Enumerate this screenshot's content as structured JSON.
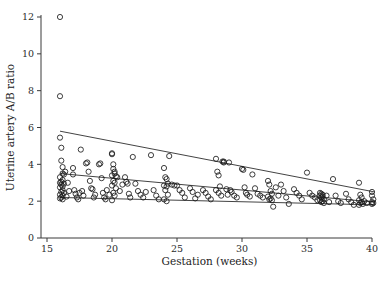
{
  "chart_data": {
    "type": "scatter",
    "title": "",
    "xlabel": "Gestation (weeks)",
    "ylabel": "Uterine artery A/B ratio",
    "xlim": [
      15,
      40
    ],
    "ylim": [
      0,
      12
    ],
    "xticks": [
      15,
      20,
      25,
      30,
      35,
      40
    ],
    "yticks": [
      0,
      2,
      4,
      6,
      8,
      10,
      12
    ],
    "xtick_labels": [
      "15",
      "20",
      "25",
      "30",
      "35",
      "40"
    ],
    "ytick_labels": [
      "0",
      "2",
      "4",
      "6",
      "8",
      "10",
      "12"
    ],
    "grid": false,
    "legend": "none",
    "marker": "open-circle",
    "marker_size": 2.6,
    "series": [
      {
        "name": "Uterine artery A/B ratio observations",
        "points": [
          [
            16.0,
            12.0
          ],
          [
            16.0,
            7.7
          ],
          [
            16.0,
            5.45
          ],
          [
            16.1,
            4.9
          ],
          [
            16.1,
            4.2
          ],
          [
            16.2,
            3.85
          ],
          [
            16.2,
            3.5
          ],
          [
            16.3,
            3.45
          ],
          [
            16.0,
            3.3
          ],
          [
            16.2,
            3.15
          ],
          [
            16.1,
            3.05
          ],
          [
            16.0,
            3.0
          ],
          [
            16.3,
            2.95
          ],
          [
            16.1,
            2.9
          ],
          [
            16.2,
            2.8
          ],
          [
            16.0,
            2.75
          ],
          [
            16.2,
            2.6
          ],
          [
            16.1,
            2.5
          ],
          [
            16.3,
            2.45
          ],
          [
            16.0,
            2.35
          ],
          [
            16.2,
            2.3
          ],
          [
            16.1,
            2.2
          ],
          [
            16.0,
            2.15
          ],
          [
            16.2,
            2.1
          ],
          [
            16.4,
            3.6
          ],
          [
            16.5,
            2.25
          ],
          [
            16.6,
            3.0
          ],
          [
            16.7,
            2.55
          ],
          [
            17.0,
            3.8
          ],
          [
            17.0,
            3.45
          ],
          [
            17.1,
            2.6
          ],
          [
            17.2,
            2.4
          ],
          [
            17.3,
            2.2
          ],
          [
            17.4,
            2.1
          ],
          [
            17.5,
            2.45
          ],
          [
            17.6,
            4.8
          ],
          [
            17.7,
            2.55
          ],
          [
            17.8,
            2.3
          ],
          [
            18.0,
            4.05
          ],
          [
            18.1,
            4.1
          ],
          [
            18.2,
            3.6
          ],
          [
            18.3,
            3.1
          ],
          [
            18.4,
            2.7
          ],
          [
            18.5,
            2.65
          ],
          [
            18.6,
            2.2
          ],
          [
            18.7,
            2.35
          ],
          [
            19.0,
            4.0
          ],
          [
            19.1,
            4.05
          ],
          [
            19.2,
            3.25
          ],
          [
            19.3,
            2.45
          ],
          [
            19.4,
            2.2
          ],
          [
            19.5,
            2.1
          ],
          [
            19.6,
            2.6
          ],
          [
            19.8,
            2.35
          ],
          [
            20.0,
            4.6
          ],
          [
            20.0,
            4.55
          ],
          [
            20.1,
            4.0
          ],
          [
            20.1,
            3.75
          ],
          [
            20.2,
            3.6
          ],
          [
            20.2,
            3.5
          ],
          [
            20.0,
            3.4
          ],
          [
            20.3,
            3.35
          ],
          [
            20.1,
            3.1
          ],
          [
            20.2,
            3.0
          ],
          [
            20.0,
            2.85
          ],
          [
            20.3,
            2.7
          ],
          [
            20.1,
            2.45
          ],
          [
            20.2,
            2.3
          ],
          [
            20.0,
            2.05
          ],
          [
            20.4,
            3.3
          ],
          [
            20.6,
            2.55
          ],
          [
            20.8,
            2.9
          ],
          [
            21.0,
            3.3
          ],
          [
            21.1,
            3.05
          ],
          [
            21.2,
            2.95
          ],
          [
            21.3,
            2.4
          ],
          [
            21.4,
            2.2
          ],
          [
            21.6,
            4.4
          ],
          [
            21.8,
            2.95
          ],
          [
            22.0,
            2.55
          ],
          [
            22.2,
            2.35
          ],
          [
            22.4,
            2.2
          ],
          [
            22.6,
            2.5
          ],
          [
            23.0,
            4.5
          ],
          [
            23.2,
            2.6
          ],
          [
            23.4,
            2.3
          ],
          [
            23.6,
            2.1
          ],
          [
            24.0,
            3.8
          ],
          [
            24.1,
            3.3
          ],
          [
            24.2,
            3.2
          ],
          [
            24.3,
            2.95
          ],
          [
            24.0,
            2.85
          ],
          [
            24.2,
            2.8
          ],
          [
            24.1,
            2.6
          ],
          [
            24.3,
            2.35
          ],
          [
            24.0,
            2.1
          ],
          [
            24.2,
            2.0
          ],
          [
            24.4,
            4.45
          ],
          [
            24.6,
            2.9
          ],
          [
            24.8,
            2.85
          ],
          [
            25.0,
            2.85
          ],
          [
            25.2,
            2.6
          ],
          [
            25.4,
            2.45
          ],
          [
            25.6,
            2.2
          ],
          [
            26.0,
            2.7
          ],
          [
            26.2,
            2.5
          ],
          [
            26.4,
            2.15
          ],
          [
            26.6,
            2.35
          ],
          [
            27.0,
            2.6
          ],
          [
            27.2,
            2.45
          ],
          [
            27.4,
            2.25
          ],
          [
            27.6,
            2.1
          ],
          [
            28.0,
            4.3
          ],
          [
            28.1,
            3.6
          ],
          [
            28.2,
            3.4
          ],
          [
            28.3,
            2.8
          ],
          [
            28.0,
            2.6
          ],
          [
            28.2,
            2.45
          ],
          [
            28.4,
            2.3
          ],
          [
            28.5,
            4.15
          ],
          [
            28.6,
            4.15
          ],
          [
            28.6,
            4.1
          ],
          [
            28.8,
            2.65
          ],
          [
            28.9,
            2.35
          ],
          [
            29.0,
            4.1
          ],
          [
            29.1,
            2.6
          ],
          [
            29.2,
            2.5
          ],
          [
            29.4,
            2.3
          ],
          [
            29.6,
            2.2
          ],
          [
            30.0,
            3.75
          ],
          [
            30.1,
            3.7
          ],
          [
            30.2,
            2.75
          ],
          [
            30.3,
            2.45
          ],
          [
            30.4,
            2.35
          ],
          [
            30.6,
            2.25
          ],
          [
            30.8,
            3.45
          ],
          [
            31.0,
            2.7
          ],
          [
            31.2,
            2.4
          ],
          [
            31.4,
            2.3
          ],
          [
            31.6,
            2.2
          ],
          [
            32.0,
            3.1
          ],
          [
            32.1,
            2.9
          ],
          [
            32.2,
            2.55
          ],
          [
            32.3,
            2.4
          ],
          [
            32.0,
            2.25
          ],
          [
            32.2,
            2.15
          ],
          [
            32.1,
            2.1
          ],
          [
            32.3,
            2.05
          ],
          [
            32.4,
            1.7
          ],
          [
            32.6,
            2.75
          ],
          [
            32.8,
            2.3
          ],
          [
            33.0,
            2.9
          ],
          [
            33.2,
            2.55
          ],
          [
            33.4,
            2.2
          ],
          [
            33.6,
            1.85
          ],
          [
            34.0,
            2.65
          ],
          [
            34.2,
            2.45
          ],
          [
            34.4,
            2.3
          ],
          [
            34.6,
            2.1
          ],
          [
            35.0,
            3.55
          ],
          [
            35.2,
            2.45
          ],
          [
            35.4,
            2.3
          ],
          [
            35.6,
            2.2
          ],
          [
            35.8,
            2.05
          ],
          [
            36.0,
            2.45
          ],
          [
            36.1,
            2.4
          ],
          [
            36.2,
            2.35
          ],
          [
            36.0,
            2.3
          ],
          [
            36.2,
            2.25
          ],
          [
            36.1,
            2.2
          ],
          [
            36.3,
            2.1
          ],
          [
            36.0,
            2.05
          ],
          [
            36.2,
            2.0
          ],
          [
            36.1,
            1.95
          ],
          [
            36.3,
            1.9
          ],
          [
            36.5,
            2.3
          ],
          [
            36.7,
            1.95
          ],
          [
            37.0,
            3.2
          ],
          [
            37.2,
            2.3
          ],
          [
            37.4,
            2.0
          ],
          [
            37.6,
            1.9
          ],
          [
            38.0,
            2.4
          ],
          [
            38.2,
            2.1
          ],
          [
            38.4,
            1.95
          ],
          [
            38.6,
            1.8
          ],
          [
            39.0,
            3.0
          ],
          [
            39.1,
            2.35
          ],
          [
            39.2,
            2.2
          ],
          [
            39.0,
            2.05
          ],
          [
            39.2,
            1.95
          ],
          [
            39.1,
            1.9
          ],
          [
            39.3,
            1.85
          ],
          [
            39.0,
            1.8
          ],
          [
            39.4,
            2.0
          ],
          [
            39.6,
            1.9
          ],
          [
            40.0,
            2.5
          ],
          [
            40.0,
            2.3
          ],
          [
            40.1,
            2.1
          ],
          [
            40.0,
            1.95
          ],
          [
            40.1,
            1.9
          ],
          [
            40.0,
            1.85
          ]
        ]
      }
    ],
    "reference_lines": [
      {
        "name": "upper-reference-line",
        "x": [
          16.0,
          40.2
        ],
        "y": [
          5.8,
          2.5
        ]
      },
      {
        "name": "median-reference-line",
        "x": [
          16.0,
          40.2
        ],
        "y": [
          3.5,
          1.95
        ]
      },
      {
        "name": "lower-reference-line",
        "x": [
          16.0,
          40.2
        ],
        "y": [
          2.2,
          1.8
        ]
      }
    ]
  }
}
